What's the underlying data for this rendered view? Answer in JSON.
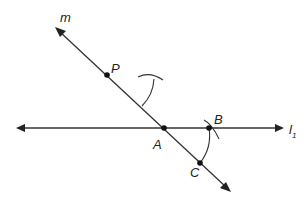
{
  "diagram": {
    "lines": {
      "m": {
        "label": "m",
        "from": [
          56,
          28
        ],
        "to": [
          230,
          191
        ]
      },
      "l1": {
        "label": "l",
        "subscript": "1",
        "from": [
          17,
          128
        ],
        "to": [
          283,
          128
        ]
      }
    },
    "points": {
      "P": {
        "label": "P",
        "x": 107,
        "y": 75
      },
      "A": {
        "label": "A",
        "x": 164,
        "y": 128
      },
      "B": {
        "label": "B",
        "x": 209,
        "y": 128
      },
      "C": {
        "label": "C",
        "x": 200,
        "y": 163
      }
    },
    "arcs": [
      {
        "name": "arc-BC-centered-A",
        "description": "arc centered at A passing through B and C"
      },
      {
        "name": "arc-near-P-lower",
        "description": "arc of same radius centered at P, crossing"
      },
      {
        "name": "arc-near-P-upper",
        "description": "arc with radius BC centered on construction point"
      },
      {
        "name": "arc-at-B",
        "description": "small arc crossing at B"
      }
    ],
    "colors": {
      "stroke": "#333333",
      "point": "#111111",
      "background": "#ffffff"
    }
  }
}
